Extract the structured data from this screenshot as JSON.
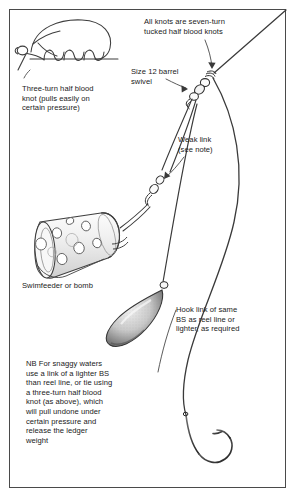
{
  "diagram": {
    "frame_color": "#4a4a4a",
    "line_color": "#3a3a3a",
    "background": "#ffffff"
  },
  "captions": {
    "all_knots": "All knots are seven-turn\ntucked half blood knots",
    "swivel": "Size 12 barrel\nswivel",
    "three_turn_knot": "Three-turn half blood\nknot (pulls easily on\ncertain pressure)",
    "weak_link": "Weak link\n(see note)",
    "swimfeeder": "Swimfeeder or bomb",
    "hook_link": "Hook link of same\nBS as reel line or\nlighter, as required",
    "nb_note": "NB For snaggy waters\nuse a link of a lighter BS\nthan reel line, or tie using\na three-turn half blood\nknot (as above), which\nwill pull undone under\ncertain pressure and\nrelease the ledger\nweight"
  },
  "parts": {
    "reel_line": "reel-line",
    "barrel_swivel": "size-12-barrel-swivel",
    "weak_link_swivel": "weak-link-connector",
    "swimfeeder": "swimfeeder-cylinder",
    "bomb_weight": "bomb-lead-weight",
    "hook": "fishing-hook",
    "knot_detail": "three-turn-half-blood-knot-detail"
  }
}
